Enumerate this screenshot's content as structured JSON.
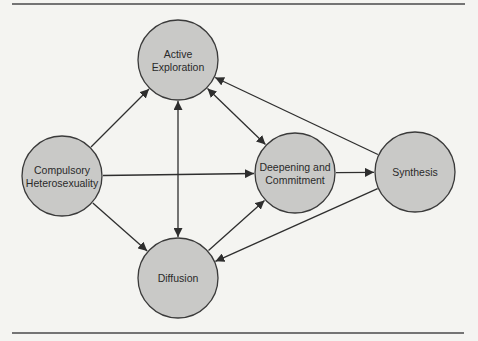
{
  "diagram": {
    "colors": {
      "background": "#f4f4f1",
      "node_fill": "#c9c9c7",
      "node_stroke": "#3a3a3a",
      "edge": "#2e2e2e",
      "rule": "#4a4a4a"
    },
    "rules": [
      {
        "x1": 12,
        "y1": 4,
        "x2": 465,
        "y2": 4
      },
      {
        "x1": 12,
        "y1": 333,
        "x2": 464,
        "y2": 333
      }
    ],
    "nodes": [
      {
        "id": "active",
        "lines": [
          "Active",
          "Exploration"
        ],
        "cx": 178,
        "cy": 60,
        "r": 40
      },
      {
        "id": "compulsory",
        "lines": [
          "Compulsory",
          "Heterosexuality"
        ],
        "cx": 62,
        "cy": 176,
        "r": 40
      },
      {
        "id": "deepening",
        "lines": [
          "Deepening and",
          "Commitment"
        ],
        "cx": 295,
        "cy": 173,
        "r": 40
      },
      {
        "id": "synthesis",
        "lines": [
          "Synthesis"
        ],
        "cx": 415,
        "cy": 172,
        "r": 40
      },
      {
        "id": "diffusion",
        "lines": [
          "Diffusion"
        ],
        "cx": 178,
        "cy": 278,
        "r": 40
      }
    ],
    "edges": [
      {
        "from": "compulsory",
        "to": "active",
        "direction": "forward"
      },
      {
        "from": "compulsory",
        "to": "deepening",
        "direction": "forward"
      },
      {
        "from": "compulsory",
        "to": "diffusion",
        "direction": "forward"
      },
      {
        "from": "active",
        "to": "diffusion",
        "direction": "both"
      },
      {
        "from": "active",
        "to": "deepening",
        "direction": "both"
      },
      {
        "from": "diffusion",
        "to": "deepening",
        "direction": "forward"
      },
      {
        "from": "deepening",
        "to": "synthesis",
        "direction": "forward"
      },
      {
        "from": "synthesis",
        "to": "active",
        "direction": "forward"
      },
      {
        "from": "synthesis",
        "to": "diffusion",
        "direction": "forward"
      }
    ]
  }
}
